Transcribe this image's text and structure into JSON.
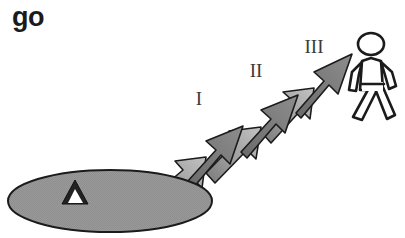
{
  "figure": {
    "title": "go"
  },
  "colors": {
    "background": "#ffffff",
    "outline": "#1b1b1b",
    "ellipse_fill": "#9a9a9a",
    "arrow_fill_light": "#b4b4b4",
    "arrow_fill_dark": "#6e6e6e",
    "tent_fill": "#222222",
    "tent_door_fill": "#ffffff",
    "pedestrian_fill": "#ffffff",
    "label_color": "#3a3a3a"
  },
  "ground": {
    "name": "oval-ground",
    "tent_icon": "tent-icon"
  },
  "arrows": [
    {
      "id": "arrow-1",
      "label": "I"
    },
    {
      "id": "arrow-2",
      "label": "II"
    },
    {
      "id": "arrow-3",
      "label": "III"
    }
  ],
  "destination": {
    "name": "pedestrian-figure",
    "icon": "walking-person-icon"
  }
}
